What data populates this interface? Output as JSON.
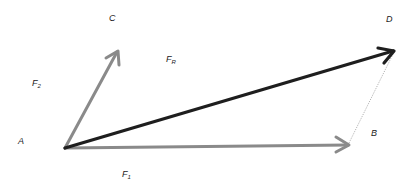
{
  "diagram": {
    "colors": {
      "component": "#8a8a8a",
      "resultant": "#1e1e1e",
      "construction": "#9a9a9a",
      "text": "#222222"
    },
    "points": {
      "A": {
        "label": "A",
        "x": 65,
        "y": 148
      },
      "B": {
        "label": "B",
        "x": 349,
        "y": 145
      },
      "C": {
        "label": "C",
        "x": 118,
        "y": 51
      },
      "D": {
        "label": "D",
        "x": 395,
        "y": 50
      }
    },
    "vectors": [
      {
        "id": "F1",
        "from": "A",
        "to": "B",
        "label": "F",
        "subscript": "1",
        "style": "component"
      },
      {
        "id": "F2",
        "from": "A",
        "to": "C",
        "label": "F",
        "subscript": "2",
        "style": "component"
      },
      {
        "id": "FR",
        "from": "A",
        "to": "D",
        "label": "F",
        "subscript": "R",
        "style": "resultant"
      }
    ],
    "construction_lines": [
      {
        "from": "B",
        "to": "D",
        "style": "dotted"
      }
    ],
    "labels": {
      "A": "A",
      "B": "B",
      "C": "C",
      "D": "D",
      "F1_main": "F",
      "F1_sub": "1",
      "F2_main": "F",
      "F2_sub": "2",
      "FR_main": "F",
      "FR_sub": "R"
    }
  }
}
